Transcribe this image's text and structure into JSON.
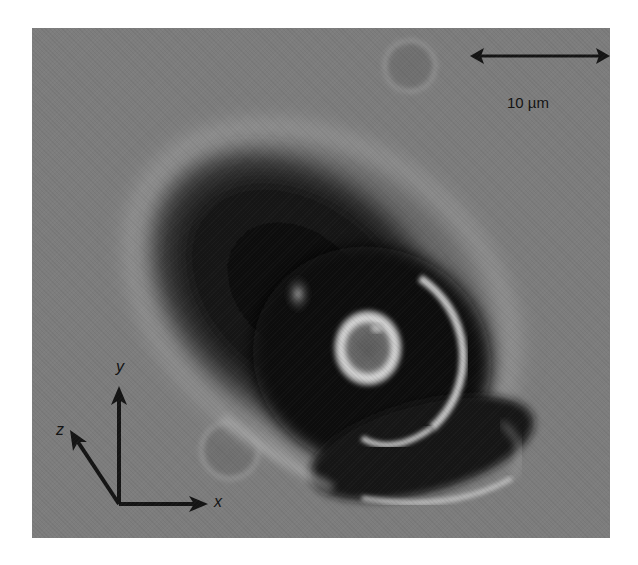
{
  "image": {
    "description": "Grayscale phase-contrast micrograph of a cell/particle with bright halo rings",
    "background_color": "#7d7d7d"
  },
  "scale_bar": {
    "label": "10 µm",
    "color": "#141414"
  },
  "axes": {
    "x_label": "x",
    "y_label": "y",
    "z_label": "z",
    "color": "#141414"
  }
}
